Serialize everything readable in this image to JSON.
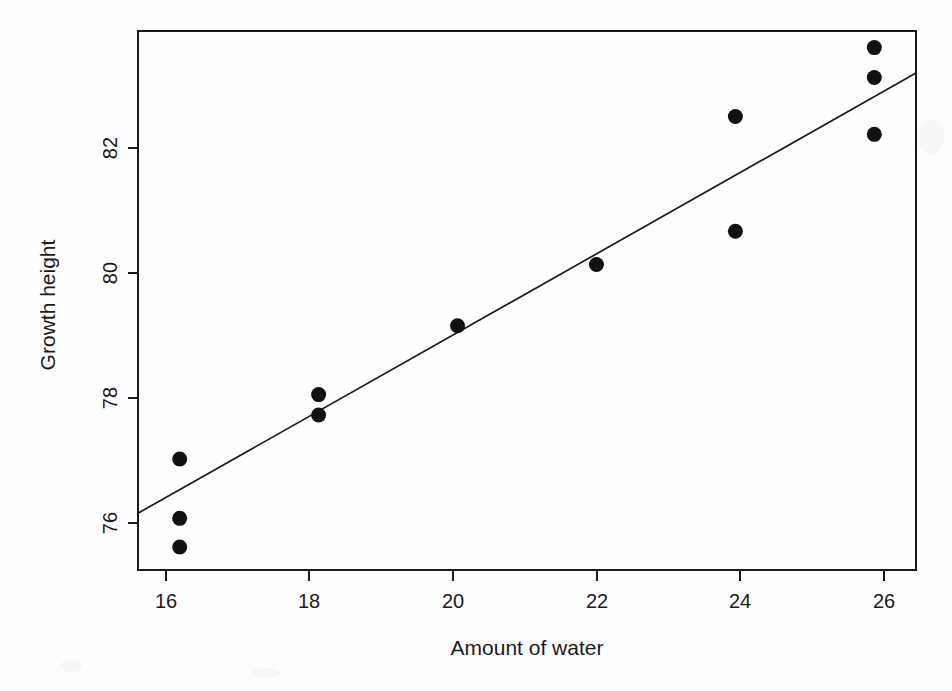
{
  "chart_data": {
    "type": "scatter",
    "title": "",
    "xlabel": "Amount of water",
    "ylabel": "Growth height",
    "xlim": [
      15.4,
      26.6
    ],
    "ylim": [
      75.35,
      83.8
    ],
    "xticks": [
      16,
      18,
      20,
      22,
      24,
      26
    ],
    "yticks": [
      76,
      78,
      80,
      82
    ],
    "xtick_labels": [
      "16",
      "18",
      "20",
      "22",
      "24",
      "26"
    ],
    "ytick_labels": [
      "76",
      "78",
      "80",
      "82"
    ],
    "grid": false,
    "legend": null,
    "point_color": "#111111",
    "line_color": "#1a1a1a",
    "x": [
      16,
      16,
      16,
      18,
      18,
      20,
      22,
      24,
      24,
      26,
      26,
      26
    ],
    "y": [
      77.09,
      76.16,
      75.71,
      78.1,
      77.78,
      79.18,
      80.14,
      82.46,
      80.66,
      83.54,
      83.07,
      82.18
    ],
    "points": [
      {
        "x": 16,
        "y": 77.09
      },
      {
        "x": 16,
        "y": 76.16
      },
      {
        "x": 16,
        "y": 75.71
      },
      {
        "x": 18,
        "y": 78.1
      },
      {
        "x": 18,
        "y": 77.78
      },
      {
        "x": 20,
        "y": 79.18
      },
      {
        "x": 22,
        "y": 80.14
      },
      {
        "x": 24,
        "y": 82.46
      },
      {
        "x": 24,
        "y": 80.66
      },
      {
        "x": 26,
        "y": 83.54
      },
      {
        "x": 26,
        "y": 83.07
      },
      {
        "x": 26,
        "y": 82.18
      }
    ],
    "series": [
      {
        "name": "observations",
        "type": "scatter",
        "values": [
          77.09,
          76.16,
          75.71,
          78.1,
          77.78,
          79.18,
          80.14,
          82.46,
          80.66,
          83.54,
          83.07,
          82.18
        ]
      },
      {
        "name": "regression-line",
        "type": "line",
        "x_endpoints": [
          15.4,
          26.6
        ],
        "y_endpoints": [
          76.24,
          83.14
        ]
      }
    ],
    "annotations": []
  },
  "axes": {
    "x_title": "Amount of water",
    "y_title": "Growth height"
  }
}
